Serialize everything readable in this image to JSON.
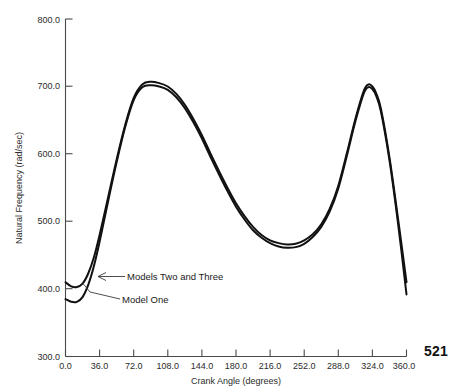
{
  "page": {
    "page_number": "521",
    "background_color": "#ffffff",
    "ink_color": "#111111"
  },
  "chart_data": {
    "type": "line",
    "title": "",
    "xlabel": "Crank Angle (degrees)",
    "ylabel": "Natural Frequency (rad/sec)",
    "xlim": [
      0.0,
      360.0
    ],
    "ylim": [
      300.0,
      800.0
    ],
    "xticks": [
      0.0,
      36.0,
      72.0,
      108.0,
      144.0,
      180.0,
      216.0,
      252.0,
      288.0,
      324.0,
      360.0
    ],
    "yticks": [
      300.0,
      400.0,
      500.0,
      600.0,
      700.0,
      800.0
    ],
    "xtick_labels": [
      "0.0",
      "36.0",
      "72.0",
      "108.0",
      "144.0",
      "180.0",
      "216.0",
      "252.0",
      "288.0",
      "324.0",
      "360.0"
    ],
    "ytick_labels": [
      "300.0",
      "400.0",
      "500.0",
      "600.0",
      "700.0",
      "800.0"
    ],
    "grid": false,
    "legend_position": "inline-annotations",
    "x": [
      0,
      6,
      12,
      18,
      24,
      30,
      36,
      45,
      54,
      63,
      72,
      81,
      90,
      99,
      108,
      117,
      126,
      135,
      144,
      153,
      162,
      171,
      180,
      189,
      198,
      207,
      216,
      225,
      234,
      243,
      252,
      261,
      270,
      279,
      288,
      297,
      306,
      315,
      320,
      324,
      328,
      333,
      342,
      351,
      360
    ],
    "series": [
      {
        "name": "Models Two and Three",
        "values": [
          410,
          404,
          403,
          408,
          423,
          447,
          480,
          536,
          592,
          643,
          683,
          703,
          707,
          705,
          700,
          689,
          673,
          652,
          628,
          601,
          575,
          550,
          527,
          508,
          492,
          480,
          472,
          468,
          466,
          467,
          472,
          481,
          496,
          519,
          553,
          601,
          652,
          694,
          703,
          700,
          690,
          667,
          595,
          505,
          410
        ]
      },
      {
        "name": "Model One",
        "values": [
          385,
          381,
          381,
          388,
          406,
          434,
          470,
          530,
          588,
          640,
          680,
          699,
          702,
          700,
          695,
          684,
          668,
          647,
          623,
          596,
          570,
          545,
          522,
          503,
          487,
          476,
          468,
          463,
          461,
          462,
          467,
          477,
          492,
          515,
          549,
          597,
          648,
          690,
          699,
          696,
          686,
          663,
          591,
          498,
          392
        ]
      }
    ],
    "annotations": [
      {
        "label": "Models Two and Three",
        "target_x": 24.0,
        "target_y": 440.0
      },
      {
        "label": "Model One",
        "target_x": 14.0,
        "target_y": 392.0
      }
    ]
  }
}
